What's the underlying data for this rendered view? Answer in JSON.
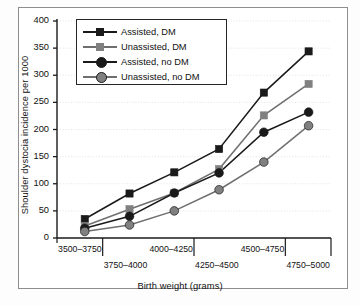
{
  "figure": {
    "y_axis_title": "Shoulder dystocia incidence per 1000",
    "x_axis_title": "Birth weight (grams)"
  },
  "chart_data": {
    "type": "line",
    "title": "",
    "xlabel": "Birth weight (grams)",
    "ylabel": "Shoulder dystocia incidence per 1000",
    "categories": [
      "3500–3750",
      "3750–4000",
      "4000–4250",
      "4250–4500",
      "4500–4750",
      "4750–5000"
    ],
    "ylim": [
      0,
      400
    ],
    "yticks": [
      0,
      50,
      100,
      150,
      200,
      250,
      300,
      350,
      400
    ],
    "grid": "horizontal-dotted",
    "legend_position": "upper-left-inside",
    "series": [
      {
        "name": "Assisted, DM",
        "marker": "square",
        "color": "#1a1a1a",
        "values": [
          35,
          82,
          121,
          164,
          268,
          344
        ]
      },
      {
        "name": "Unassisted, DM",
        "marker": "square",
        "color": "#808080",
        "values": [
          22,
          53,
          83,
          127,
          226,
          284
        ]
      },
      {
        "name": "Assisted, no DM",
        "marker": "circle",
        "color": "#1a1a1a",
        "values": [
          18,
          40,
          83,
          120,
          195,
          232
        ]
      },
      {
        "name": "Unassisted, no DM",
        "marker": "circle",
        "color": "#808080",
        "values": [
          12,
          24,
          50,
          89,
          140,
          207
        ]
      }
    ]
  }
}
